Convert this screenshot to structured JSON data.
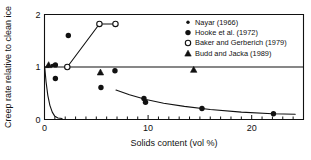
{
  "chart_data": {
    "type": "scatter",
    "title": "",
    "xlabel": "Solids content (vol %)",
    "ylabel": "Creep rate relative to clean ice",
    "xlim": [
      0,
      25
    ],
    "ylim": [
      0,
      2
    ],
    "xticks": [
      0,
      10,
      20
    ],
    "xtick_labels": [
      "0",
      "10",
      "20"
    ],
    "yticks": [
      0,
      1,
      2
    ],
    "ytick_labels": [
      "0",
      "1",
      "2"
    ],
    "xminor_step": 1,
    "grid": false,
    "reference_line_y": 1,
    "legend_position": "top-right",
    "series": [
      {
        "name": "Nayar (1966)",
        "marker": "small-filled-circle",
        "color": "#111111",
        "points": [
          {
            "x": 0.35,
            "y": 1.02
          },
          {
            "x": 0.75,
            "y": 1.03
          }
        ]
      },
      {
        "name": "Hooke et al. (1972)",
        "marker": "filled-circle",
        "color": "#111111",
        "points": [
          {
            "x": 1.05,
            "y": 1.04
          },
          {
            "x": 2.3,
            "y": 1.6
          },
          {
            "x": 1.05,
            "y": 0.78
          },
          {
            "x": 5.45,
            "y": 0.61
          },
          {
            "x": 6.8,
            "y": 0.93
          },
          {
            "x": 9.6,
            "y": 0.4
          },
          {
            "x": 9.75,
            "y": 0.33
          },
          {
            "x": 15.2,
            "y": 0.21
          },
          {
            "x": 22.1,
            "y": 0.11
          }
        ]
      },
      {
        "name": "Baker and Gerberich (1979)",
        "marker": "open-circle",
        "color": "#111111",
        "connected": true,
        "points": [
          {
            "x": 2.2,
            "y": 1.0
          },
          {
            "x": 5.3,
            "y": 1.82
          },
          {
            "x": 6.85,
            "y": 1.82
          }
        ]
      },
      {
        "name": "Budd and Jacka (1989)",
        "marker": "filled-triangle",
        "color": "#111111",
        "points": [
          {
            "x": 0.4,
            "y": 1.04
          },
          {
            "x": 5.4,
            "y": 0.9
          },
          {
            "x": 14.4,
            "y": 0.95
          }
        ]
      }
    ],
    "curves": [
      {
        "name": "steep-decay-curve",
        "points": [
          {
            "x": 0.02,
            "y": 1.0
          },
          {
            "x": 0.15,
            "y": 0.72
          },
          {
            "x": 0.32,
            "y": 0.46
          },
          {
            "x": 0.52,
            "y": 0.27
          },
          {
            "x": 0.75,
            "y": 0.14
          },
          {
            "x": 1.0,
            "y": 0.06
          },
          {
            "x": 1.3,
            "y": 0.03
          },
          {
            "x": 1.7,
            "y": 0.02
          }
        ]
      },
      {
        "name": "gradual-decay-curve",
        "points": [
          {
            "x": 6.9,
            "y": 0.56
          },
          {
            "x": 8.2,
            "y": 0.47
          },
          {
            "x": 9.8,
            "y": 0.38
          },
          {
            "x": 11.5,
            "y": 0.31
          },
          {
            "x": 13.5,
            "y": 0.25
          },
          {
            "x": 16.0,
            "y": 0.19
          },
          {
            "x": 19.0,
            "y": 0.14
          },
          {
            "x": 22.0,
            "y": 0.11
          },
          {
            "x": 24.2,
            "y": 0.1
          }
        ]
      }
    ]
  },
  "axes": {
    "xlabel": "Solids content (vol %)",
    "ylabel": "Creep rate relative to clean ice",
    "xtick_0": "0",
    "xtick_10": "10",
    "xtick_20": "20",
    "ytick_0": "0",
    "ytick_1": "1",
    "ytick_2": "2"
  },
  "legend": {
    "items": [
      {
        "label": "Nayar (1966)",
        "marker": "small-filled-circle"
      },
      {
        "label": "Hooke et al. (1972)",
        "marker": "filled-circle"
      },
      {
        "label": "Baker and Gerberich (1979)",
        "marker": "open-circle"
      },
      {
        "label": "Budd and Jacka (1989)",
        "marker": "filled-triangle"
      }
    ]
  }
}
